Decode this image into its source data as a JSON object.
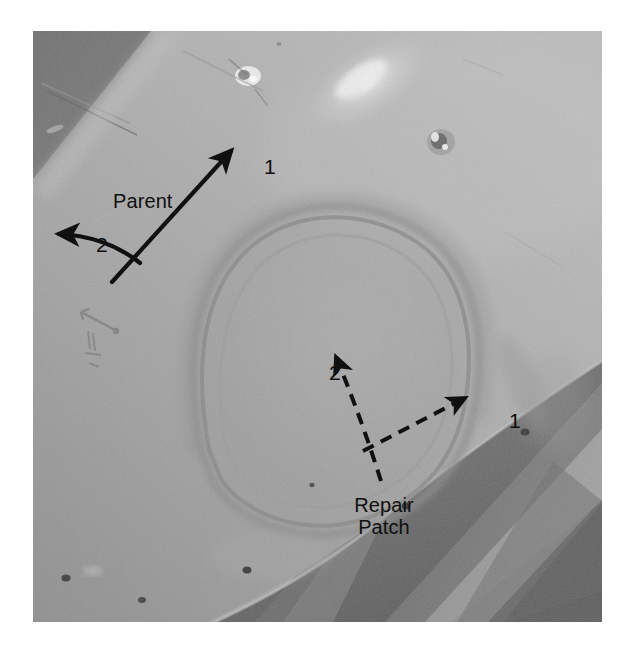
{
  "figure": {
    "kind": "annotated-photograph",
    "colorspace": "grayscale",
    "photo": {
      "left": 33,
      "top": 31,
      "width": 569,
      "height": 591,
      "border_color": "#ffffff",
      "background_color": "#9a9a9a"
    }
  },
  "annotations": {
    "parent": {
      "label": "Parent",
      "axis_1_label": "1",
      "axis_2_label": "2",
      "line_style": "solid",
      "color": "#101010",
      "origin": {
        "x": 118,
        "y": 272
      },
      "axis_1_tip": {
        "x": 233,
        "y": 152
      },
      "axis_2_tip": {
        "x": 53,
        "y": 250
      }
    },
    "repair_patch": {
      "label_line_1": "Repair",
      "label_line_2": "Patch",
      "axis_1_label": "1",
      "axis_2_label": "2",
      "line_style": "dashed",
      "color": "#101010",
      "origin": {
        "x": 383,
        "y": 434
      },
      "axis_1_tip": {
        "x": 467,
        "y": 393
      },
      "axis_2_tip": {
        "x": 341,
        "y": 345
      }
    }
  },
  "photo_features": {
    "patch_outline": "rounded oval bonded repair patch, center-left of panel",
    "surface_defects": [
      {
        "name": "bright-fastener-mark",
        "x": 248,
        "y": 76
      },
      {
        "name": "dark-fastener-mark",
        "x": 441,
        "y": 142
      }
    ],
    "fastener_holes": [
      {
        "x": 66,
        "y": 578
      },
      {
        "x": 142,
        "y": 600
      },
      {
        "x": 247,
        "y": 570
      },
      {
        "x": 406,
        "y": 506
      },
      {
        "x": 525,
        "y": 432
      }
    ],
    "pencil_mark": {
      "x": 98,
      "y": 318,
      "note": "faint handwritten dimension mark"
    },
    "specular_highlight": {
      "x": 366,
      "y": 78
    },
    "dark_upper_left_region": "out-of-plane shadowed structure",
    "lower_right_structure": "dark angled substructure ribs / stringers"
  }
}
